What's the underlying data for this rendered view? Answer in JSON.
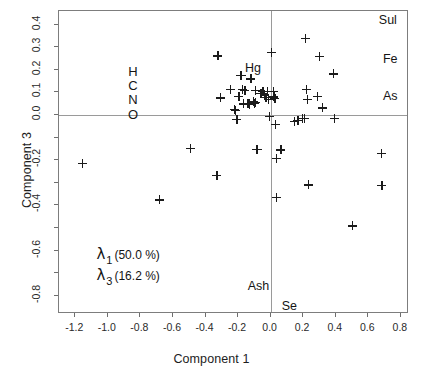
{
  "chart_data": {
    "type": "scatter",
    "title": "",
    "xlabel": "Component 1",
    "ylabel": "Component 3",
    "xlim": [
      -1.3,
      0.85
    ],
    "ylim": [
      -0.88,
      0.46
    ],
    "grid": false,
    "reference_lines": {
      "x": 0.0,
      "y": 0.0
    },
    "legend_position": "lower-left",
    "xticks": [
      -1.2,
      -1.0,
      -0.8,
      -0.6,
      -0.4,
      -0.2,
      0.0,
      0.2,
      0.4,
      0.6,
      0.8
    ],
    "xtick_labels": [
      "-1.2",
      "-1.0",
      "-0.8",
      "-0.6",
      "-0.4",
      "-0.2",
      "0.0",
      "0.2",
      "0.4",
      "0.6",
      "0.8"
    ],
    "yticks": [
      0.4,
      0.3,
      0.2,
      0.1,
      0.0,
      -0.1,
      -0.2,
      -0.3,
      -0.4,
      -0.5,
      -0.6,
      -0.7,
      -0.8
    ],
    "ytick_labels": [
      "0.4",
      "0.3",
      "0.2",
      "0.1",
      "0.0",
      "",
      "-0.2",
      "",
      "-0.4",
      "",
      "-0.6",
      "",
      "-0.8"
    ],
    "marker": "plus",
    "marker_color": "#1b1b1b",
    "points": [
      {
        "x": -1.155,
        "y": -0.215
      },
      {
        "x": -0.685,
        "y": -0.375
      },
      {
        "x": -0.495,
        "y": -0.148
      },
      {
        "x": -0.325,
        "y": 0.262
      },
      {
        "x": -0.33,
        "y": -0.268
      },
      {
        "x": -0.308,
        "y": 0.076
      },
      {
        "x": -0.248,
        "y": 0.112
      },
      {
        "x": -0.222,
        "y": 0.024
      },
      {
        "x": -0.215,
        "y": 0.021
      },
      {
        "x": -0.208,
        "y": -0.018
      },
      {
        "x": -0.196,
        "y": 0.083
      },
      {
        "x": -0.185,
        "y": 0.176
      },
      {
        "x": -0.178,
        "y": 0.176
      },
      {
        "x": -0.172,
        "y": 0.113
      },
      {
        "x": -0.166,
        "y": 0.05
      },
      {
        "x": -0.158,
        "y": 0.109
      },
      {
        "x": -0.14,
        "y": 0.05
      },
      {
        "x": -0.134,
        "y": 0.052
      },
      {
        "x": -0.13,
        "y": 0.048
      },
      {
        "x": -0.122,
        "y": 0.16
      },
      {
        "x": -0.108,
        "y": 0.058
      },
      {
        "x": -0.1,
        "y": 0.052
      },
      {
        "x": -0.096,
        "y": 0.108
      },
      {
        "x": -0.092,
        "y": 0.056
      },
      {
        "x": -0.086,
        "y": -0.151
      },
      {
        "x": -0.08,
        "y": -0.153
      },
      {
        "x": -0.06,
        "y": 0.097
      },
      {
        "x": -0.048,
        "y": 0.104
      },
      {
        "x": -0.04,
        "y": 0.092
      },
      {
        "x": -0.03,
        "y": 0.078
      },
      {
        "x": -0.022,
        "y": 0.106
      },
      {
        "x": -0.012,
        "y": 0.07
      },
      {
        "x": -0.008,
        "y": -0.006
      },
      {
        "x": 0.004,
        "y": 0.278
      },
      {
        "x": 0.016,
        "y": 0.106
      },
      {
        "x": 0.02,
        "y": 0.08
      },
      {
        "x": 0.026,
        "y": 0.074
      },
      {
        "x": 0.03,
        "y": -0.04
      },
      {
        "x": 0.034,
        "y": -0.193
      },
      {
        "x": 0.036,
        "y": -0.364
      },
      {
        "x": 0.062,
        "y": -0.154
      },
      {
        "x": 0.146,
        "y": -0.027
      },
      {
        "x": 0.168,
        "y": -0.023
      },
      {
        "x": 0.196,
        "y": -0.015
      },
      {
        "x": 0.206,
        "y": -0.014
      },
      {
        "x": 0.212,
        "y": 0.34
      },
      {
        "x": 0.22,
        "y": 0.112
      },
      {
        "x": 0.224,
        "y": 0.07
      },
      {
        "x": 0.232,
        "y": -0.309
      },
      {
        "x": 0.286,
        "y": 0.084
      },
      {
        "x": 0.3,
        "y": 0.258
      },
      {
        "x": 0.316,
        "y": 0.032
      },
      {
        "x": 0.384,
        "y": 0.182
      },
      {
        "x": 0.392,
        "y": -0.016
      },
      {
        "x": 0.502,
        "y": -0.49
      },
      {
        "x": 0.678,
        "y": -0.17
      },
      {
        "x": 0.684,
        "y": -0.31
      }
    ],
    "variable_labels": [
      {
        "text": "H",
        "x": -0.845,
        "y": 0.193,
        "name": "variable-label-h"
      },
      {
        "text": "C",
        "x": -0.845,
        "y": 0.133,
        "name": "variable-label-c"
      },
      {
        "text": "N",
        "x": -0.845,
        "y": 0.07,
        "name": "variable-label-n"
      },
      {
        "text": "O",
        "x": -0.845,
        "y": 0.006,
        "name": "variable-label-o"
      },
      {
        "text": "Hg",
        "x": -0.108,
        "y": 0.208,
        "name": "variable-label-hg"
      },
      {
        "text": "Sul",
        "x": 0.72,
        "y": 0.42,
        "name": "variable-label-sul"
      },
      {
        "text": "Fe",
        "x": 0.735,
        "y": 0.248,
        "name": "variable-label-fe"
      },
      {
        "text": "As",
        "x": 0.735,
        "y": 0.084,
        "name": "variable-label-as"
      },
      {
        "text": "Ash",
        "x": -0.075,
        "y": -0.757,
        "name": "variable-label-ash"
      },
      {
        "text": "Se",
        "x": 0.115,
        "y": -0.845,
        "name": "variable-label-se"
      }
    ],
    "eigenvalues": [
      {
        "symbol": "λ",
        "subscript": "1",
        "percent": "(50.0 %)",
        "value": 50.0
      },
      {
        "symbol": "λ",
        "subscript": "3",
        "percent": "(16.2 %)",
        "value": 16.2
      }
    ]
  },
  "axes": {
    "x_title": "Component 1",
    "y_title": "Component 3"
  },
  "colors": {
    "frame": "#7d7d7d",
    "reference_line": "#9a9a9a",
    "marker": "#1b1b1b",
    "text": "#1a1a1a",
    "background": "#ffffff"
  }
}
